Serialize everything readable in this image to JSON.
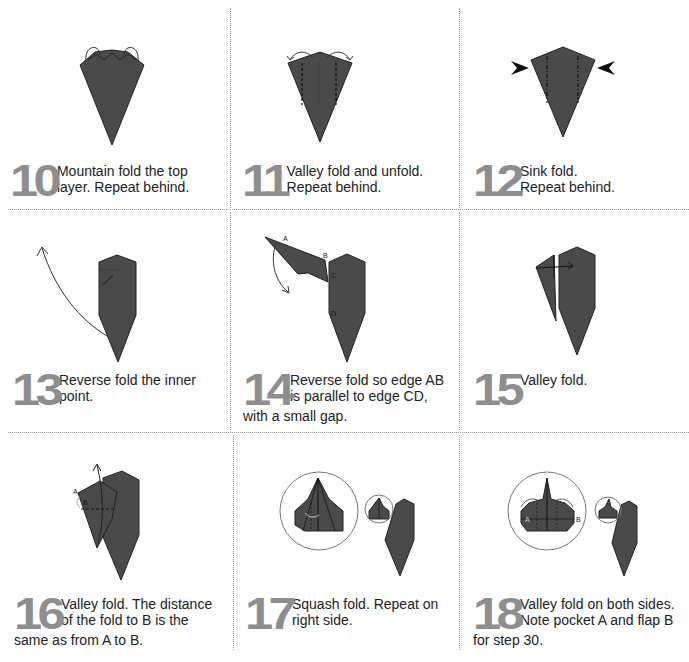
{
  "page": {
    "type": "origami instructions",
    "colors": {
      "paper": "#4a4a4a",
      "paper_edge": "#222222",
      "step_number": "#8e8e8e",
      "divider": "#9a9a9a",
      "text": "#222222"
    }
  },
  "steps": [
    {
      "number": "10",
      "line1": "Mountain fold the top",
      "line2": "layer. Repeat behind.",
      "line3": ""
    },
    {
      "number": "11",
      "line1": "Valley fold and unfold.",
      "line2": "Repeat behind.",
      "line3": ""
    },
    {
      "number": "12",
      "line1": "Sink fold.",
      "line2": "Repeat behind.",
      "line3": ""
    },
    {
      "number": "13",
      "line1": "Reverse fold the inner",
      "line2": "point.",
      "line3": ""
    },
    {
      "number": "14",
      "line1": "Reverse fold so edge AB",
      "line2": "is parallel to edge CD,",
      "line3": "with a small gap."
    },
    {
      "number": "15",
      "line1": "Valley fold.",
      "line2": "",
      "line3": ""
    },
    {
      "number": "16",
      "line1": "Valley fold. The distance",
      "line2": "of the fold to B is the",
      "line3": "same as from A to B."
    },
    {
      "number": "17",
      "line1": "Squash fold. Repeat on",
      "line2": "right side.",
      "line3": ""
    },
    {
      "number": "18",
      "line1": "Valley fold on both sides.",
      "line2": "Note pocket A and flap B",
      "line3": "for step 30."
    }
  ],
  "labels": {
    "step14": {
      "a": "A",
      "b": "B",
      "c": "C",
      "d": "D"
    },
    "step16": {
      "a": "A",
      "b": "B"
    },
    "step18": {
      "a": "A",
      "b": "B"
    }
  }
}
